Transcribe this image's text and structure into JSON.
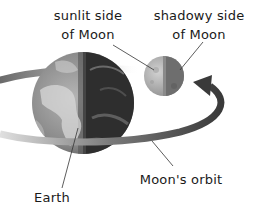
{
  "labels": {
    "sunlit_line1": "sunlit side",
    "sunlit_line2": "of Moon",
    "shadowy_line1": "shadowy side",
    "shadowy_line2": "of Moon",
    "orbit": "Moon's orbit",
    "earth": "Earth"
  },
  "colors": {
    "text": "#1a1a1a",
    "orbit_dark": "#4a4a4a",
    "orbit_light": "#c8c8c8",
    "earth_light": "#9a9a9a",
    "earth_dark": "#2e2e2e",
    "moon_light": "#bdbdbd",
    "moon_dark": "#6e6e6e"
  }
}
